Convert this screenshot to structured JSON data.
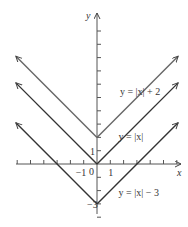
{
  "chart_data": {
    "type": "line",
    "title": "",
    "xlabel": "x",
    "ylabel": "y",
    "xlim": [
      -6,
      6
    ],
    "ylim": [
      -4,
      11
    ],
    "x_ticks": [
      -6,
      -5,
      -4,
      -3,
      -2,
      -1,
      1,
      2,
      3,
      4,
      5,
      6
    ],
    "y_ticks": [
      -4,
      -3,
      -2,
      -1,
      1,
      2,
      3,
      4,
      5,
      6,
      7,
      8,
      9,
      10
    ],
    "x_tick_labels": [
      {
        "value": -1,
        "text": "−1"
      },
      {
        "value": 1,
        "text": "1"
      }
    ],
    "y_tick_labels": [
      {
        "value": 1,
        "text": "1"
      },
      {
        "value": -3,
        "text": "−3"
      }
    ],
    "origin_label": "0",
    "grid": false,
    "series": [
      {
        "name": "y = |x| + 2",
        "shift": 2,
        "x": [
          -6.1,
          0,
          6.1
        ],
        "y": [
          8.1,
          2,
          8.1
        ],
        "color": "#666666",
        "label_at": [
          1.5,
          5.5
        ]
      },
      {
        "name": "y = |x|",
        "shift": 0,
        "x": [
          -6.1,
          0,
          6.1
        ],
        "y": [
          6.1,
          0,
          6.1
        ],
        "color": "#333333",
        "label_at": [
          1.4,
          2.1
        ]
      },
      {
        "name": "y = |x| − 3",
        "shift": -3,
        "x": [
          -6.1,
          0,
          6.1
        ],
        "y": [
          3.1,
          -3,
          3.1
        ],
        "color": "#333333",
        "label_at": [
          1.4,
          -2.1
        ]
      }
    ]
  }
}
